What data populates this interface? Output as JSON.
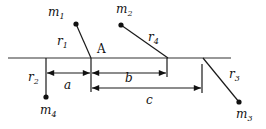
{
  "diagram": {
    "type": "physics-mass-positions",
    "colors": {
      "ink": "#111111",
      "background": "#ffffff"
    },
    "axis": {
      "x1": 8,
      "x2": 231,
      "y": 58
    },
    "point_A": {
      "label": "A",
      "x": 91,
      "y": 58
    },
    "masses": [
      {
        "id": "m1",
        "base": "m",
        "sub": "1",
        "dot": [
          76,
          24
        ],
        "anchor": [
          91,
          58
        ],
        "label_pos": [
          48,
          16
        ],
        "rod": {
          "base": "r",
          "sub": "1",
          "label_pos": [
            57,
            45
          ]
        }
      },
      {
        "id": "m2",
        "base": "m",
        "sub": "2",
        "dot": [
          121,
          25
        ],
        "anchor": [
          168,
          58
        ],
        "label_pos": [
          116,
          13
        ],
        "rod": {
          "base": "r",
          "sub": "4",
          "label_pos": [
            148,
            41
          ]
        }
      },
      {
        "id": "m3",
        "base": "m",
        "sub": "3",
        "dot": [
          239,
          102
        ],
        "anchor": [
          203,
          58
        ],
        "label_pos": [
          236,
          118
        ],
        "rod": {
          "base": "r",
          "sub": "3",
          "label_pos": [
            229,
            78
          ]
        }
      },
      {
        "id": "m4",
        "base": "m",
        "sub": "4",
        "dot": [
          46,
          97
        ],
        "anchor": [
          46,
          58
        ],
        "label_pos": [
          40,
          114
        ],
        "rod": {
          "base": "r",
          "sub": "2",
          "label_pos": [
            28,
            81
          ]
        }
      }
    ],
    "dimensions": [
      {
        "label": "a",
        "from_x": 46,
        "to_x": 91,
        "y": 73,
        "label_pos": [
          62,
          89
        ]
      },
      {
        "label": "b",
        "from_x": 91,
        "to_x": 167,
        "y": 73,
        "label_pos": [
          125,
          81
        ]
      },
      {
        "label": "c",
        "from_x": 91,
        "to_x": 202,
        "y": 88,
        "label_pos": [
          146,
          104
        ]
      }
    ],
    "ticks": [
      {
        "x": 91,
        "y1": 58,
        "y2": 92
      },
      {
        "x": 167,
        "y1": 58,
        "y2": 77
      },
      {
        "x": 202,
        "y1": 64,
        "y2": 93
      }
    ]
  }
}
